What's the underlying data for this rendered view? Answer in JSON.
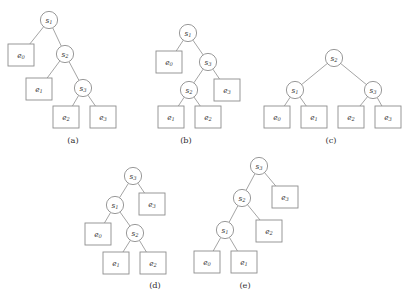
{
  "figure": {
    "width": 407,
    "height": 301,
    "background": "#ffffff",
    "stroke_color": "#8d8d8d",
    "edge_color": "#9a9a9a",
    "text_color": "#3a3a3a",
    "circle_radius": 8.6,
    "box_width": 26,
    "box_height": 22
  },
  "panels": [
    {
      "id": "a",
      "caption": "(a)",
      "caption_x": 73,
      "caption_y": 140,
      "nodes": [
        {
          "name": "s1",
          "type": "circle",
          "base": "s",
          "sub": "1",
          "x": 49,
          "y": 20
        },
        {
          "name": "e0",
          "type": "box",
          "base": "e",
          "sub": "0",
          "x": 21,
          "y": 55
        },
        {
          "name": "s2",
          "type": "circle",
          "base": "s",
          "sub": "2",
          "x": 65,
          "y": 54
        },
        {
          "name": "e1",
          "type": "box",
          "base": "e",
          "sub": "1",
          "x": 39,
          "y": 89
        },
        {
          "name": "s3",
          "type": "circle",
          "base": "s",
          "sub": "3",
          "x": 83,
          "y": 88
        },
        {
          "name": "e2",
          "type": "box",
          "base": "e",
          "sub": "2",
          "x": 66,
          "y": 117
        },
        {
          "name": "e3",
          "type": "box",
          "base": "e",
          "sub": "3",
          "x": 103,
          "y": 117
        }
      ],
      "edges": [
        [
          "s1",
          "e0"
        ],
        [
          "s1",
          "s2"
        ],
        [
          "s2",
          "e1"
        ],
        [
          "s2",
          "s3"
        ],
        [
          "s3",
          "e2"
        ],
        [
          "s3",
          "e3"
        ]
      ]
    },
    {
      "id": "b",
      "caption": "(b)",
      "caption_x": 186,
      "caption_y": 140,
      "nodes": [
        {
          "name": "s1",
          "type": "circle",
          "base": "s",
          "sub": "1",
          "x": 188,
          "y": 33
        },
        {
          "name": "e0",
          "type": "box",
          "base": "e",
          "sub": "0",
          "x": 169,
          "y": 62
        },
        {
          "name": "s3",
          "type": "circle",
          "base": "s",
          "sub": "3",
          "x": 208,
          "y": 62
        },
        {
          "name": "s2",
          "type": "circle",
          "base": "s",
          "sub": "2",
          "x": 189,
          "y": 90
        },
        {
          "name": "e3",
          "type": "box",
          "base": "e",
          "sub": "3",
          "x": 227,
          "y": 90
        },
        {
          "name": "e1",
          "type": "box",
          "base": "e",
          "sub": "1",
          "x": 171,
          "y": 117
        },
        {
          "name": "e2",
          "type": "box",
          "base": "e",
          "sub": "2",
          "x": 208,
          "y": 117
        }
      ],
      "edges": [
        [
          "s1",
          "e0"
        ],
        [
          "s1",
          "s3"
        ],
        [
          "s3",
          "s2"
        ],
        [
          "s3",
          "e3"
        ],
        [
          "s2",
          "e1"
        ],
        [
          "s2",
          "e2"
        ]
      ]
    },
    {
      "id": "c",
      "caption": "(c)",
      "caption_x": 331,
      "caption_y": 140,
      "nodes": [
        {
          "name": "s2",
          "type": "circle",
          "base": "s",
          "sub": "2",
          "x": 334,
          "y": 58
        },
        {
          "name": "s1",
          "type": "circle",
          "base": "s",
          "sub": "1",
          "x": 295,
          "y": 90
        },
        {
          "name": "s3",
          "type": "circle",
          "base": "s",
          "sub": "3",
          "x": 373,
          "y": 90
        },
        {
          "name": "e0",
          "type": "box",
          "base": "e",
          "sub": "0",
          "x": 277,
          "y": 117
        },
        {
          "name": "e1",
          "type": "box",
          "base": "e",
          "sub": "1",
          "x": 314,
          "y": 117
        },
        {
          "name": "e2",
          "type": "box",
          "base": "e",
          "sub": "2",
          "x": 351,
          "y": 117
        },
        {
          "name": "e3",
          "type": "box",
          "base": "e",
          "sub": "3",
          "x": 388,
          "y": 117
        }
      ],
      "edges": [
        [
          "s2",
          "s1"
        ],
        [
          "s2",
          "s3"
        ],
        [
          "s1",
          "e0"
        ],
        [
          "s1",
          "e1"
        ],
        [
          "s3",
          "e2"
        ],
        [
          "s3",
          "e3"
        ]
      ]
    },
    {
      "id": "d",
      "caption": "(d)",
      "caption_x": 155,
      "caption_y": 285,
      "nodes": [
        {
          "name": "s3",
          "type": "circle",
          "base": "s",
          "sub": "3",
          "x": 133,
          "y": 176
        },
        {
          "name": "s1",
          "type": "circle",
          "base": "s",
          "sub": "1",
          "x": 115,
          "y": 205
        },
        {
          "name": "e3",
          "type": "box",
          "base": "e",
          "sub": "3",
          "x": 152,
          "y": 204
        },
        {
          "name": "e0",
          "type": "box",
          "base": "e",
          "sub": "0",
          "x": 98,
          "y": 234
        },
        {
          "name": "s2",
          "type": "circle",
          "base": "s",
          "sub": "2",
          "x": 135,
          "y": 233
        },
        {
          "name": "e1",
          "type": "box",
          "base": "e",
          "sub": "1",
          "x": 116,
          "y": 263
        },
        {
          "name": "e2",
          "type": "box",
          "base": "e",
          "sub": "2",
          "x": 153,
          "y": 263
        }
      ],
      "edges": [
        [
          "s3",
          "s1"
        ],
        [
          "s3",
          "e3"
        ],
        [
          "s1",
          "e0"
        ],
        [
          "s1",
          "s2"
        ],
        [
          "s2",
          "e1"
        ],
        [
          "s2",
          "e2"
        ]
      ]
    },
    {
      "id": "e",
      "caption": "(e)",
      "caption_x": 245,
      "caption_y": 285,
      "nodes": [
        {
          "name": "s3",
          "type": "circle",
          "base": "s",
          "sub": "3",
          "x": 259,
          "y": 166
        },
        {
          "name": "s2",
          "type": "circle",
          "base": "s",
          "sub": "2",
          "x": 242,
          "y": 198
        },
        {
          "name": "e3",
          "type": "box",
          "base": "e",
          "sub": "3",
          "x": 285,
          "y": 197
        },
        {
          "name": "s1",
          "type": "circle",
          "base": "s",
          "sub": "1",
          "x": 225,
          "y": 230
        },
        {
          "name": "e2",
          "type": "box",
          "base": "e",
          "sub": "2",
          "x": 269,
          "y": 231
        },
        {
          "name": "e0",
          "type": "box",
          "base": "e",
          "sub": "0",
          "x": 207,
          "y": 262
        },
        {
          "name": "e1",
          "type": "box",
          "base": "e",
          "sub": "1",
          "x": 244,
          "y": 262
        }
      ],
      "edges": [
        [
          "s3",
          "s2"
        ],
        [
          "s3",
          "e3"
        ],
        [
          "s2",
          "s1"
        ],
        [
          "s2",
          "e2"
        ],
        [
          "s1",
          "e0"
        ],
        [
          "s1",
          "e1"
        ]
      ]
    }
  ]
}
